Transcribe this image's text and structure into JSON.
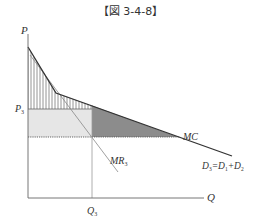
{
  "figure": {
    "title": "【図 3-4-8】",
    "axes": {
      "y_label": "P",
      "x_label": "Q"
    },
    "labels": {
      "price": "P",
      "price_sub": "3",
      "quantity": "Q",
      "quantity_sub": "3",
      "mc": "MC",
      "mr": "MR",
      "mr_sub": "3",
      "demand": "D",
      "demand_sub": "3",
      "demand_eq": "=D",
      "demand_sub1": "1",
      "demand_plus": "+D",
      "demand_sub2": "2"
    },
    "colors": {
      "line": "#333333",
      "light_fill": "#e6e6e6",
      "dark_fill": "#8c8c8c",
      "hatch": "#777777",
      "mr_line": "#888888"
    }
  }
}
